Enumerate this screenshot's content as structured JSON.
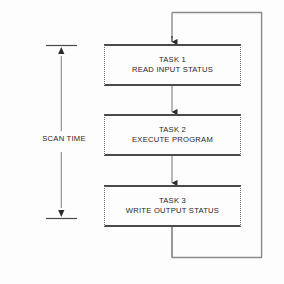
{
  "diagram": {
    "background_color": "#fdfdfd",
    "line_color": "#4a4a4a",
    "text_color": "#1d1d1d",
    "dashed_border_color": "#6d6d6d"
  },
  "scan_time": {
    "label": "SCAN TIME"
  },
  "tasks": [
    {
      "id": "task-1",
      "title": "TASK 1",
      "description": "READ INPUT STATUS"
    },
    {
      "id": "task-2",
      "title": "TASK 2",
      "description": "EXECUTE PROGRAM"
    },
    {
      "id": "task-3",
      "title": "TASK 3",
      "description": "WRITE OUTPUT STATUS"
    }
  ],
  "connectors": {
    "entry_arrow": "arrow-down-icon",
    "task1_to_task2": "arrow-down-icon",
    "task2_to_task3": "arrow-down-icon",
    "feedback_loop": "loop-back-path",
    "scan_top_arrow": "arrow-down-icon",
    "scan_bottom_arrow": "arrow-down-icon"
  }
}
